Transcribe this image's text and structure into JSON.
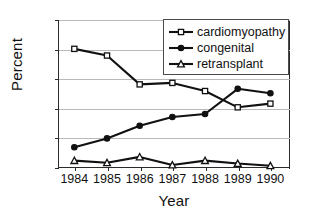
{
  "chart_data": {
    "type": "line",
    "title": "",
    "xlabel": "Year",
    "ylabel": "Percent",
    "categories": [
      "1984",
      "1985",
      "1986",
      "1987",
      "1988",
      "1989",
      "1990"
    ],
    "x": [
      1984,
      1985,
      1986,
      1987,
      1988,
      1989,
      1990
    ],
    "xlim": [
      1983.5,
      1990.6
    ],
    "ylim": [
      0,
      100
    ],
    "yticks": [
      0,
      20,
      40,
      60,
      80,
      100
    ],
    "ytick_labels": [
      "0",
      "20",
      "40",
      "60",
      "80",
      "100"
    ],
    "grid": "horizontal",
    "legend_position": "upper-right-inside",
    "series": [
      {
        "name": "cardiomyopathy",
        "marker": "open-square",
        "color": "#111111",
        "values": [
          80.5,
          76,
          56.5,
          57.5,
          52,
          41,
          43.5
        ]
      },
      {
        "name": "congenital",
        "marker": "filled-circle",
        "color": "#111111",
        "values": [
          14,
          20,
          28.5,
          34.5,
          36.5,
          53.5,
          50.5
        ]
      },
      {
        "name": "retransplant",
        "marker": "open-triangle",
        "color": "#111111",
        "values": [
          5,
          3.5,
          7.5,
          2,
          5,
          3,
          1.5
        ]
      }
    ]
  },
  "legend": {
    "items": [
      {
        "label": "cardiomyopathy",
        "marker": "open-square"
      },
      {
        "label": "congenital",
        "marker": "filled-circle"
      },
      {
        "label": "retransplant",
        "marker": "open-triangle"
      }
    ]
  },
  "axes": {
    "y_title": "Percent",
    "x_title": "Year"
  }
}
